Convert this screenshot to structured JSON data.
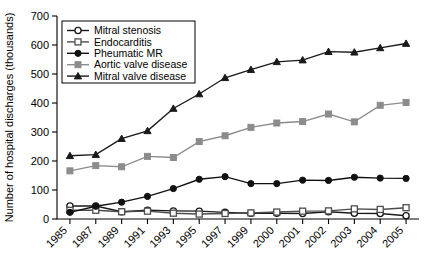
{
  "chart_data": {
    "type": "line",
    "title": "",
    "xlabel": "",
    "ylabel": "Number of hospital discharges (thousands)",
    "ylim": [
      0,
      700
    ],
    "yticks": [
      0,
      100,
      200,
      300,
      400,
      500,
      600,
      700
    ],
    "grid": false,
    "legend_position": "top-left",
    "categories": [
      "1985",
      "1987",
      "1989",
      "1991",
      "1993",
      "1995",
      "1997",
      "1999",
      "2000",
      "2001",
      "2002",
      "2003",
      "2004",
      "2005"
    ],
    "series": [
      {
        "name": "Mitral stenosis",
        "marker": "open-circle",
        "color": "#1a1a1a",
        "values": [
          45,
          45,
          25,
          30,
          28,
          27,
          23,
          20,
          20,
          19,
          25,
          20,
          19,
          11
        ]
      },
      {
        "name": "Endocarditis",
        "marker": "open-square",
        "color": "#4d4d4d",
        "values": [
          30,
          30,
          25,
          27,
          20,
          17,
          19,
          21,
          24,
          27,
          28,
          35,
          33,
          39
        ]
      },
      {
        "name": "Pheumatic MR",
        "marker": "filled-circle",
        "color": "#111111",
        "values": [
          23,
          44,
          58,
          78,
          105,
          137,
          146,
          122,
          122,
          134,
          133,
          144,
          141,
          140
        ]
      },
      {
        "name": "Aortic valve disease",
        "marker": "filled-square",
        "color": "#8c8c8c",
        "values": [
          166,
          184,
          180,
          216,
          212,
          267,
          287,
          316,
          331,
          336,
          362,
          335,
          392,
          402
        ]
      },
      {
        "name": "Mitral valve disease",
        "marker": "filled-triangle",
        "color": "#1a1a1a",
        "values": [
          218,
          222,
          277,
          304,
          381,
          431,
          487,
          515,
          542,
          548,
          577,
          575,
          590,
          605
        ]
      }
    ]
  }
}
